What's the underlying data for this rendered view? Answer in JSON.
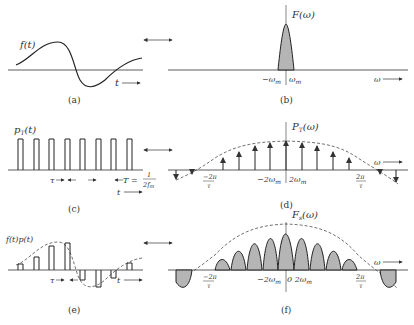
{
  "panels": {
    "a": {
      "caption": "(a)",
      "ylabel": "f(t)",
      "xlabel": "t"
    },
    "b": {
      "caption": "(b)",
      "ylabel": "F(ω)",
      "xlabel": "ω",
      "ticks": [
        "−ω",
        "ω"
      ],
      "tick_sub": "m"
    },
    "c": {
      "caption": "(c)",
      "ylabel": "p",
      "ylabel_sub": "T",
      "ylabel_arg": "(t)",
      "xlabel": "t",
      "tau": "τ",
      "period": "T =",
      "frac_num": "1",
      "frac_den": "2f",
      "frac_sub": "m"
    },
    "d": {
      "caption": "(d)",
      "ylabel": "P",
      "ylabel_sub": "T",
      "ylabel_arg": "(ω)",
      "xlabel": "ω",
      "ticks": [
        "−2ω",
        "2ω"
      ],
      "tick_sub": "m",
      "neg_num": "−2π",
      "pos_num": "2π",
      "den": "τ"
    },
    "e": {
      "caption": "(e)",
      "ylabel": "f(t)p(t)",
      "xlabel": "t",
      "tau": "τ"
    },
    "f": {
      "caption": "(f)",
      "ylabel": "F",
      "ylabel_sub": "s",
      "ylabel_arg": "(ω)",
      "xlabel": "ω",
      "ticks": [
        "−2ω",
        "0 2ω"
      ],
      "tick_sub": "m",
      "neg_num": "−2π",
      "pos_num": "2π",
      "den": "τ"
    }
  },
  "transform_arrow": "⟷"
}
